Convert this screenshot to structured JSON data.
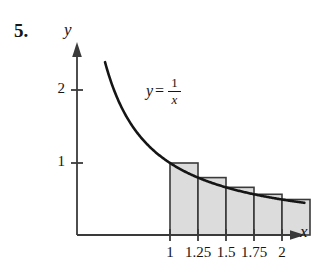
{
  "figure": {
    "problem_number": "5.",
    "curve_label": {
      "lhs": "y",
      "equals": "=",
      "numerator": "1",
      "denominator": "x"
    },
    "y_axis_label": "y",
    "x_axis_label": "x"
  },
  "chart_data": {
    "type": "area",
    "title": "",
    "subtitle": "",
    "xlabel": "x",
    "ylabel": "y",
    "function": "y = 1/x",
    "grid": false,
    "legend": false,
    "xlim": [
      0,
      2.35
    ],
    "ylim": [
      0,
      2.6
    ],
    "x_ticks": [
      1,
      1.25,
      1.5,
      1.75,
      2
    ],
    "x_tick_labels": [
      "1",
      "1.25",
      "1.5",
      "1.75",
      "2"
    ],
    "y_ticks": [
      1,
      2
    ],
    "y_tick_labels": [
      "1",
      "2"
    ],
    "curve": {
      "name": "y = 1/x",
      "x_start": 0.42,
      "x_end": 2.2,
      "color": "#151515"
    },
    "riemann": {
      "method": "left-endpoint",
      "interval": [
        1,
        2
      ],
      "n": 4,
      "width": 0.25,
      "fill_color": "#dcdcdc",
      "edge_color": "#3a3a3a",
      "bars": [
        {
          "x_left": 1.0,
          "x_right": 1.25,
          "height": 1.0
        },
        {
          "x_left": 1.25,
          "x_right": 1.5,
          "height": 0.8
        },
        {
          "x_left": 1.5,
          "x_right": 1.75,
          "height": 0.6667
        },
        {
          "x_left": 1.75,
          "x_right": 2.0,
          "height": 0.5714
        },
        {
          "x_left": 2.0,
          "x_right": 2.25,
          "height": 0.5
        }
      ]
    }
  }
}
